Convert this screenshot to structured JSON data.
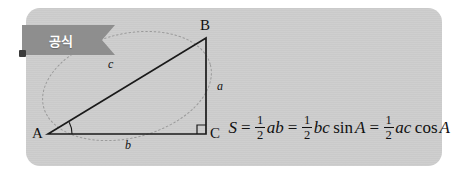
{
  "card": {
    "background_color": "#cccccc",
    "page_background": "#ffffff"
  },
  "banner": {
    "label": "공식",
    "color": "#8e8e8e",
    "text_color": "#ffffff"
  },
  "figure": {
    "vertices": [
      {
        "name": "A",
        "label": "A",
        "x": 22,
        "y": 126
      },
      {
        "name": "B",
        "label": "B",
        "x": 180,
        "y": 30
      },
      {
        "name": "C",
        "label": "C",
        "x": 180,
        "y": 126
      }
    ],
    "side_labels": [
      {
        "name": "a",
        "label": "a",
        "x": 193,
        "y": 84
      },
      {
        "name": "b",
        "label": "b",
        "x": 101,
        "y": 143
      },
      {
        "name": "c",
        "label": "c",
        "x": 84,
        "y": 62
      }
    ],
    "markers": {
      "right_angle_at": "C",
      "angle_arc_at": "A",
      "circumscribed_ellipse": "dotted"
    },
    "line_color": "#1a1a1a",
    "dotted_color": "#9a9a9a"
  },
  "formula": {
    "text": "S = 1/2 ab = 1/2 bc sin A = 1/2 ac cos A",
    "S": "S",
    "eq1": "=",
    "eq2": "=",
    "eq3": "=",
    "frac1_num": "1",
    "frac1_den": "2",
    "frac2_num": "1",
    "frac2_den": "2",
    "frac3_num": "1",
    "frac3_den": "2",
    "term1": "ab",
    "term2": "bc",
    "sin": "sin",
    "angle_sin": "A",
    "term3": "ac",
    "cos": "cos",
    "angle_cos": "A"
  }
}
